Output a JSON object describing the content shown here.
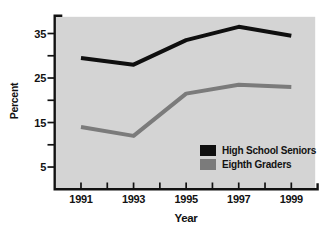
{
  "chart_data": {
    "type": "line",
    "title": "",
    "xlabel": "Year",
    "ylabel": "Percent",
    "x": [
      1991,
      1993,
      1995,
      1997,
      1999
    ],
    "series": [
      {
        "name": "High School Seniors",
        "color": "#0f0f0f",
        "values": [
          29.5,
          28,
          33.5,
          36.5,
          34.5
        ]
      },
      {
        "name": "Eighth Graders",
        "color": "#7b7b7b",
        "values": [
          14,
          12,
          21.5,
          23.5,
          23
        ]
      }
    ],
    "xlim": [
      1990,
      2000
    ],
    "ylim": [
      0,
      39
    ],
    "x_ticks": [
      1991,
      1992,
      1993,
      1994,
      1995,
      1996,
      1997,
      1998,
      1999
    ],
    "x_tick_labels": [
      "1991",
      "1993",
      "1995",
      "1997",
      "1999"
    ],
    "x_label_years": [
      1991,
      1993,
      1995,
      1997,
      1999
    ],
    "y_ticks": [
      5,
      10,
      15,
      20,
      25,
      30,
      35
    ],
    "y_tick_labels": [
      "5",
      "15",
      "25",
      "35"
    ],
    "y_label_values": [
      5,
      15,
      25,
      35
    ],
    "grid": false,
    "legend_position": "inside-bottom-right",
    "colors": {
      "plot_background": "#d4d4d4",
      "axis": "#121212",
      "text": "#121212",
      "page_background": "#ffffff"
    }
  }
}
